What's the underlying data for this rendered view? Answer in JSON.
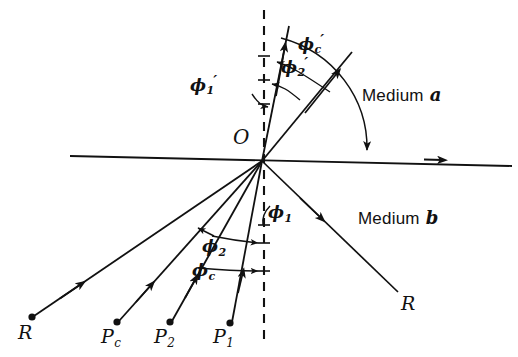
{
  "figure": {
    "type": "optics-ray-diagram",
    "width": 518,
    "height": 357,
    "background": "#ffffff",
    "ink_color": "#111111"
  },
  "origin": {
    "label": "O",
    "x": 262,
    "y": 161
  },
  "media": {
    "upper": {
      "text": "Medium",
      "symbol": "a",
      "x": 410,
      "y": 97
    },
    "lower": {
      "text": "Medium",
      "symbol": "b",
      "x": 405,
      "y": 220
    }
  },
  "angles_above": [
    {
      "name": "phi-1-prime",
      "base": "ϕ",
      "sub": "1",
      "prime": "′",
      "x": 196,
      "y": 84
    },
    {
      "name": "phi-2-prime",
      "base": "ϕ",
      "sub": "2",
      "prime": "′",
      "x": 286,
      "y": 66
    },
    {
      "name": "phi-c-prime",
      "base": "ϕ",
      "sub": "c",
      "prime": "′",
      "x": 303,
      "y": 43
    }
  ],
  "angles_below": [
    {
      "name": "phi-1",
      "base": "ϕ",
      "sub": "1",
      "x": 272,
      "y": 214
    },
    {
      "name": "phi-2",
      "base": "ϕ",
      "sub": "2",
      "x": 206,
      "y": 248
    },
    {
      "name": "phi-c",
      "base": "ϕ",
      "sub": "c",
      "x": 196,
      "y": 272
    }
  ],
  "sources": [
    {
      "name": "source-R",
      "label": "R",
      "sub": "",
      "dot_x": 32,
      "dot_y": 317,
      "label_x": 18,
      "label_y": 326
    },
    {
      "name": "source-Pc",
      "label": "P",
      "sub": "c",
      "dot_x": 117,
      "dot_y": 322,
      "label_x": 102,
      "label_y": 330
    },
    {
      "name": "source-P2",
      "label": "P",
      "sub": "2",
      "dot_x": 170,
      "dot_y": 322,
      "label_x": 155,
      "label_y": 330
    },
    {
      "name": "source-P1",
      "label": "P",
      "sub": "1",
      "dot_x": 230,
      "dot_y": 323,
      "label_x": 214,
      "label_y": 330
    }
  ],
  "reflected": {
    "name": "reflected-ray-R",
    "label": "R",
    "label_x": 404,
    "label_y": 298
  },
  "interface": {
    "name": "interface-line",
    "x1": 70,
    "y1": 156,
    "x2": 512,
    "y2": 166,
    "arrow_at_x": 432
  },
  "normal": {
    "name": "normal-dashed-line",
    "x": 264,
    "y1": 10,
    "y2": 346,
    "dash": "9 7"
  }
}
